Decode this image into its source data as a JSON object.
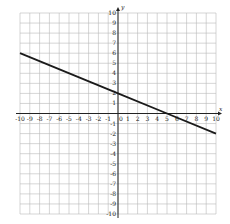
{
  "chart_data": {
    "type": "line",
    "title": "",
    "xlabel": "x",
    "ylabel": "y",
    "xlim": [
      -10,
      10
    ],
    "ylim": [
      -10,
      10
    ],
    "grid": true,
    "x_ticks": [
      "-10",
      "-9",
      "-8",
      "-7",
      "-6",
      "-5",
      "-4",
      "-3",
      "-2",
      "-1",
      "0",
      "1",
      "2",
      "3",
      "4",
      "5",
      "6",
      "7",
      "8",
      "9",
      "10"
    ],
    "y_ticks": [
      "10",
      "9",
      "8",
      "7",
      "6",
      "5",
      "4",
      "3",
      "2",
      "1",
      "-1",
      "-2",
      "-3",
      "-4",
      "-5",
      "-6",
      "-7",
      "-8",
      "-9",
      "-10"
    ],
    "series": [
      {
        "name": "line",
        "equation": "y = -0.4x + 2",
        "x": [
          -10,
          0,
          5,
          10
        ],
        "y": [
          6,
          2,
          0,
          -2
        ],
        "color": "#1a1a1a"
      }
    ],
    "legend": null
  },
  "colors": {
    "grid": "#b8b8b8",
    "axis": "#222222",
    "line": "#1a1a1a",
    "background": "#ffffff"
  }
}
